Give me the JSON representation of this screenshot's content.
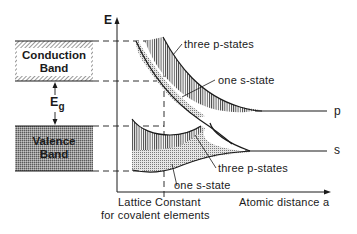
{
  "diagram": {
    "axes": {
      "y_label": "E",
      "x_label": "Atomic distance  a"
    },
    "bands": {
      "conduction": {
        "line1": "Conduction",
        "line2": "Band"
      },
      "valence": {
        "line1": "Valence",
        "line2": "Band"
      },
      "gap_label": "E",
      "gap_subscript": "g"
    },
    "lattice_constant": {
      "line1": "Lattice Constant",
      "line2": "for covalent elements"
    },
    "annotations": {
      "upper_p": "three  p-states",
      "upper_s": "one  s-state",
      "lower_p": "three  p-states",
      "lower_s": "one  s-state"
    },
    "level_labels": {
      "p": "p",
      "s": "s"
    },
    "colors": {
      "ink": "#1a1a1a",
      "background": "#ffffff"
    }
  }
}
